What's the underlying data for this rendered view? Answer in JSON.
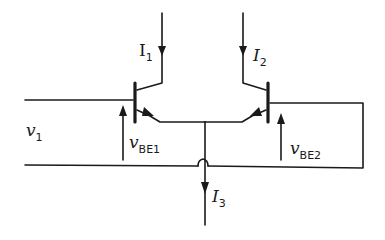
{
  "diagram": {
    "type": "circuit",
    "labels": {
      "i1": {
        "main": "I",
        "sub": "1"
      },
      "i2": {
        "main": "I",
        "sub": "2"
      },
      "i3": {
        "main": "I",
        "sub": "3"
      },
      "v1": {
        "main": "v",
        "sub": "1"
      },
      "vbe1": {
        "main": "v",
        "sub": "BE1"
      },
      "vbe2": {
        "main": "v",
        "sub": "BE2"
      }
    },
    "components": [
      {
        "id": "Q1",
        "kind": "npn-transistor",
        "side": "left"
      },
      {
        "id": "Q2",
        "kind": "npn-transistor",
        "side": "right"
      }
    ],
    "colors": {
      "line": "#1a1a1a",
      "background": "#ffffff"
    }
  }
}
